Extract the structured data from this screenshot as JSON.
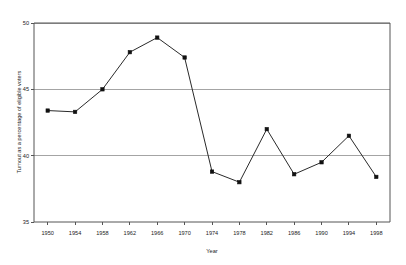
{
  "chart_data": {
    "type": "line",
    "title": "",
    "subtitle": "",
    "xlabel": "Year",
    "ylabel": "Turnout as a percentage of eligible voters",
    "x": [
      1950,
      1954,
      1958,
      1962,
      1966,
      1970,
      1974,
      1978,
      1982,
      1986,
      1990,
      1994,
      1998
    ],
    "values": [
      43.4,
      43.3,
      45.0,
      47.8,
      48.9,
      47.4,
      38.8,
      38.0,
      42.0,
      38.6,
      39.5,
      41.5,
      38.4
    ],
    "series": [
      {
        "name": "Turnout",
        "values": [
          43.4,
          43.3,
          45.0,
          47.8,
          48.9,
          47.4,
          38.8,
          38.0,
          42.0,
          38.6,
          39.5,
          41.5,
          38.4
        ]
      }
    ],
    "categories": [
      "1950",
      "1954",
      "1958",
      "1962",
      "1966",
      "1970",
      "1974",
      "1978",
      "1982",
      "1986",
      "1990",
      "1994",
      "1998"
    ],
    "xtick_labels": [
      "1950",
      "1954",
      "1958",
      "1962",
      "1966",
      "1970",
      "1974",
      "1978",
      "1982",
      "1986",
      "1990",
      "1994",
      "1998"
    ],
    "ytick_labels": [
      "50",
      "45",
      "40",
      "35"
    ],
    "ytick_values": [
      50,
      45,
      40,
      35
    ],
    "xlim": [
      1948,
      2000
    ],
    "ylim": [
      35,
      50
    ],
    "grid": "horizontal",
    "legend": "none",
    "marker": "filled-square",
    "line_color": "#2a2a2a",
    "marker_color": "#111111",
    "grid_color": "#9a9a9a",
    "frame_color": "#555555",
    "background_color": "#ffffff",
    "annotations": []
  }
}
